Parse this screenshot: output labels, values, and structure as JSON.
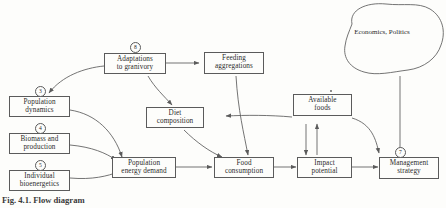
{
  "figure": {
    "caption": "Fig. 4.1. Flow diagram",
    "stroke_color": "#5b5b5b",
    "text_color": "#2b2b2b",
    "background_color": "#fdfdfb"
  },
  "nodes": {
    "adaptations": {
      "label": "Adaptations to granivory",
      "line1": "Adaptations",
      "line2": "to granivory",
      "badge": "8"
    },
    "feeding": {
      "label": "Feeding aggregations",
      "line1": "Feeding",
      "line2": "aggregations"
    },
    "population_dynamics": {
      "label": "Population dynamics",
      "line1": "Population",
      "line2": "dynamics",
      "badge": "3"
    },
    "biomass": {
      "label": "Biomass and production",
      "line1": "Biomass and",
      "line2": "production",
      "badge": "4"
    },
    "bioenergetics": {
      "label": "Individual bioenergetics",
      "line1": "Individual",
      "line2": "bioenergetics",
      "badge": "5"
    },
    "diet": {
      "label": "Diet composition",
      "line1": "Diet",
      "line2": "composition"
    },
    "available_foods": {
      "label": "Available foods",
      "line1": "Available",
      "line2": "foods"
    },
    "energy_demand": {
      "label": "Population energy demand",
      "line1": "Population",
      "line2": "energy demand"
    },
    "food_consumption": {
      "label": "Food consumption",
      "line1": "Food",
      "line2": "consumption"
    },
    "impact": {
      "label": "Impact potential",
      "line1": "Impact",
      "line2": "potential"
    },
    "management": {
      "label": "Management strategy",
      "line1": "Management",
      "line2": "strategy",
      "badge": "7"
    },
    "economics": {
      "label": "Economics, Politics",
      "line1": "Economics,",
      "line2": "Politics"
    }
  },
  "edges": [
    {
      "from": "adaptations",
      "to": "population_dynamics"
    },
    {
      "from": "adaptations",
      "to": "feeding"
    },
    {
      "from": "adaptations",
      "to": "diet"
    },
    {
      "from": "feeding",
      "to": "food_consumption"
    },
    {
      "from": "population_dynamics",
      "to": "energy_demand"
    },
    {
      "from": "biomass",
      "to": "energy_demand"
    },
    {
      "from": "bioenergetics",
      "to": "energy_demand"
    },
    {
      "from": "energy_demand",
      "to": "food_consumption"
    },
    {
      "from": "diet",
      "to": "food_consumption"
    },
    {
      "from": "food_consumption",
      "to": "impact"
    },
    {
      "from": "available_foods",
      "to": "diet"
    },
    {
      "from": "available_foods",
      "to": "impact"
    },
    {
      "from": "available_foods",
      "to": "management"
    },
    {
      "from": "impact",
      "to": "available_foods"
    },
    {
      "from": "impact",
      "to": "management"
    },
    {
      "from": "economics",
      "to": "management"
    }
  ]
}
